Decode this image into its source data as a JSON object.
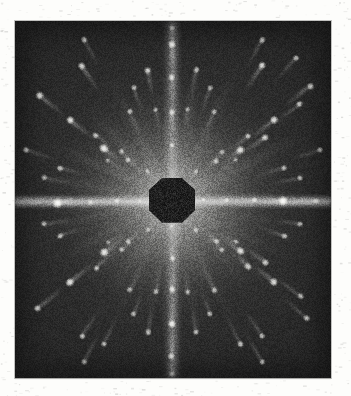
{
  "document": {
    "kind": "x-ray-diffraction-photograph",
    "technique": "Laue transmission photograph",
    "caption": "",
    "paper_color": "#fdfdfb",
    "plate_background_color": "#262626",
    "beam_stop_color": "#1d1d1d",
    "spot_color": "#ffffff"
  },
  "plate": {
    "x": 15,
    "y": 21,
    "width": 316,
    "height": 357,
    "center_x": 172,
    "center_y": 201
  },
  "beam_stop": {
    "shape": "octagon",
    "center_x": 172,
    "center_y": 200,
    "width": 46,
    "height": 45
  },
  "streaks": {
    "horizontal": {
      "y": 201,
      "thickness": 13,
      "length": 316
    },
    "vertical": {
      "x": 172,
      "thickness": 16,
      "length": 357
    }
  },
  "chart_data": {
    "type": "scatter",
    "title": "",
    "subtitle": "",
    "xlabel": "",
    "ylabel": "",
    "xlim": [
      15,
      331
    ],
    "ylim": [
      21,
      378
    ],
    "grid": false,
    "legend": null,
    "series": [
      {
        "name": "diffraction-spots",
        "x": [
          172,
          172,
          172,
          172,
          172,
          172,
          172,
          172,
          58,
          90,
          117,
          140,
          204,
          227,
          254,
          283,
          316,
          104,
          128,
          148,
          196,
          216,
          240,
          265,
          104,
          128,
          148,
          196,
          216,
          240,
          265,
          70,
          96,
          122,
          222,
          248,
          274,
          300,
          70,
          96,
          122,
          222,
          248,
          274,
          300,
          40,
          148,
          196,
          310,
          38,
          148,
          196,
          306,
          82,
          130,
          214,
          262,
          82,
          130,
          214,
          262,
          60,
          108,
          236,
          284,
          60,
          108,
          236,
          284,
          156,
          188,
          156,
          188,
          134,
          210,
          134,
          210,
          44,
          300,
          44,
          300,
          172,
          172,
          26,
          320,
          262,
          84,
          262,
          84,
          172,
          240,
          104,
          296
        ],
        "y": [
          44,
          78,
          112,
          145,
          258,
          290,
          324,
          356,
          203,
          202,
          201,
          201,
          200,
          200,
          200,
          201,
          201,
          148,
          160,
          172,
          172,
          161,
          150,
          138,
          252,
          242,
          230,
          230,
          241,
          251,
          262,
          120,
          135,
          152,
          250,
          266,
          282,
          296,
          282,
          268,
          250,
          152,
          136,
          120,
          104,
          96,
          70,
          70,
          86,
          308,
          332,
          332,
          318,
          66,
          112,
          112,
          66,
          336,
          290,
          290,
          336,
          168,
          160,
          160,
          168,
          236,
          242,
          242,
          236,
          110,
          110,
          292,
          292,
          88,
          88,
          314,
          314,
          178,
          178,
          224,
          224,
          28,
          374,
          150,
          252,
          40,
          40,
          362,
          362,
          226,
          344,
          344,
          58
        ],
        "marker": "round-spot",
        "color": "#ffffff"
      }
    ]
  },
  "spots": [
    {
      "cx": 172,
      "cy": 44,
      "r": 4.2,
      "i": 0.95
    },
    {
      "cx": 172,
      "cy": 78,
      "r": 3.6,
      "i": 0.85
    },
    {
      "cx": 172,
      "cy": 112,
      "r": 3.4,
      "i": 0.8
    },
    {
      "cx": 172,
      "cy": 145,
      "r": 3.0,
      "i": 0.72
    },
    {
      "cx": 172,
      "cy": 258,
      "r": 3.2,
      "i": 0.78
    },
    {
      "cx": 172,
      "cy": 290,
      "r": 3.6,
      "i": 0.86
    },
    {
      "cx": 172,
      "cy": 324,
      "r": 4.0,
      "i": 0.92
    },
    {
      "cx": 172,
      "cy": 356,
      "r": 3.4,
      "i": 0.8
    },
    {
      "cx": 58,
      "cy": 203,
      "r": 5.0,
      "i": 1.0
    },
    {
      "cx": 90,
      "cy": 202,
      "r": 3.2,
      "i": 0.72
    },
    {
      "cx": 117,
      "cy": 201,
      "r": 2.8,
      "i": 0.64
    },
    {
      "cx": 140,
      "cy": 201,
      "r": 2.4,
      "i": 0.56
    },
    {
      "cx": 204,
      "cy": 200,
      "r": 2.6,
      "i": 0.6
    },
    {
      "cx": 227,
      "cy": 200,
      "r": 2.8,
      "i": 0.66
    },
    {
      "cx": 254,
      "cy": 200,
      "r": 3.0,
      "i": 0.7
    },
    {
      "cx": 283,
      "cy": 201,
      "r": 5.2,
      "i": 1.0
    },
    {
      "cx": 316,
      "cy": 201,
      "r": 3.4,
      "i": 0.82
    },
    {
      "cx": 104,
      "cy": 148,
      "r": 4.4,
      "i": 0.94
    },
    {
      "cx": 128,
      "cy": 160,
      "r": 3.0,
      "i": 0.72
    },
    {
      "cx": 148,
      "cy": 172,
      "r": 2.6,
      "i": 0.62
    },
    {
      "cx": 196,
      "cy": 172,
      "r": 2.6,
      "i": 0.62
    },
    {
      "cx": 216,
      "cy": 161,
      "r": 3.0,
      "i": 0.72
    },
    {
      "cx": 240,
      "cy": 150,
      "r": 4.2,
      "i": 0.92
    },
    {
      "cx": 265,
      "cy": 138,
      "r": 3.6,
      "i": 0.84
    },
    {
      "cx": 104,
      "cy": 252,
      "r": 4.4,
      "i": 0.94
    },
    {
      "cx": 128,
      "cy": 242,
      "r": 3.0,
      "i": 0.72
    },
    {
      "cx": 148,
      "cy": 230,
      "r": 2.6,
      "i": 0.62
    },
    {
      "cx": 196,
      "cy": 230,
      "r": 2.8,
      "i": 0.66
    },
    {
      "cx": 216,
      "cy": 241,
      "r": 3.2,
      "i": 0.76
    },
    {
      "cx": 240,
      "cy": 251,
      "r": 4.0,
      "i": 0.9
    },
    {
      "cx": 265,
      "cy": 262,
      "r": 3.4,
      "i": 0.8
    },
    {
      "cx": 70,
      "cy": 120,
      "r": 4.0,
      "i": 0.9
    },
    {
      "cx": 96,
      "cy": 135,
      "r": 3.2,
      "i": 0.76
    },
    {
      "cx": 122,
      "cy": 152,
      "r": 2.8,
      "i": 0.66
    },
    {
      "cx": 222,
      "cy": 250,
      "r": 2.8,
      "i": 0.66
    },
    {
      "cx": 248,
      "cy": 266,
      "r": 3.4,
      "i": 0.8
    },
    {
      "cx": 274,
      "cy": 282,
      "r": 3.8,
      "i": 0.88
    },
    {
      "cx": 300,
      "cy": 296,
      "r": 3.2,
      "i": 0.76
    },
    {
      "cx": 70,
      "cy": 282,
      "r": 4.2,
      "i": 0.92
    },
    {
      "cx": 96,
      "cy": 268,
      "r": 3.2,
      "i": 0.76
    },
    {
      "cx": 122,
      "cy": 250,
      "r": 2.8,
      "i": 0.66
    },
    {
      "cx": 222,
      "cy": 152,
      "r": 2.8,
      "i": 0.66
    },
    {
      "cx": 248,
      "cy": 136,
      "r": 3.2,
      "i": 0.78
    },
    {
      "cx": 274,
      "cy": 120,
      "r": 3.8,
      "i": 0.88
    },
    {
      "cx": 300,
      "cy": 104,
      "r": 3.2,
      "i": 0.76
    },
    {
      "cx": 40,
      "cy": 96,
      "r": 3.8,
      "i": 0.88
    },
    {
      "cx": 148,
      "cy": 70,
      "r": 3.4,
      "i": 0.82
    },
    {
      "cx": 196,
      "cy": 70,
      "r": 3.0,
      "i": 0.74
    },
    {
      "cx": 310,
      "cy": 86,
      "r": 3.4,
      "i": 0.82
    },
    {
      "cx": 38,
      "cy": 308,
      "r": 3.4,
      "i": 0.8
    },
    {
      "cx": 148,
      "cy": 332,
      "r": 3.0,
      "i": 0.74
    },
    {
      "cx": 196,
      "cy": 332,
      "r": 3.0,
      "i": 0.74
    },
    {
      "cx": 306,
      "cy": 318,
      "r": 3.2,
      "i": 0.78
    },
    {
      "cx": 82,
      "cy": 66,
      "r": 3.4,
      "i": 0.82
    },
    {
      "cx": 130,
      "cy": 112,
      "r": 2.8,
      "i": 0.68
    },
    {
      "cx": 214,
      "cy": 112,
      "r": 2.8,
      "i": 0.68
    },
    {
      "cx": 262,
      "cy": 66,
      "r": 3.6,
      "i": 0.86
    },
    {
      "cx": 82,
      "cy": 336,
      "r": 3.2,
      "i": 0.78
    },
    {
      "cx": 130,
      "cy": 290,
      "r": 2.8,
      "i": 0.68
    },
    {
      "cx": 214,
      "cy": 290,
      "r": 3.0,
      "i": 0.72
    },
    {
      "cx": 262,
      "cy": 336,
      "r": 3.0,
      "i": 0.74
    },
    {
      "cx": 60,
      "cy": 168,
      "r": 3.2,
      "i": 0.78
    },
    {
      "cx": 108,
      "cy": 160,
      "r": 2.4,
      "i": 0.58
    },
    {
      "cx": 236,
      "cy": 160,
      "r": 2.6,
      "i": 0.62
    },
    {
      "cx": 284,
      "cy": 168,
      "r": 3.0,
      "i": 0.74
    },
    {
      "cx": 60,
      "cy": 236,
      "r": 3.0,
      "i": 0.74
    },
    {
      "cx": 108,
      "cy": 242,
      "r": 2.4,
      "i": 0.58
    },
    {
      "cx": 236,
      "cy": 242,
      "r": 2.6,
      "i": 0.62
    },
    {
      "cx": 284,
      "cy": 236,
      "r": 3.0,
      "i": 0.74
    },
    {
      "cx": 156,
      "cy": 110,
      "r": 2.6,
      "i": 0.64
    },
    {
      "cx": 188,
      "cy": 110,
      "r": 2.6,
      "i": 0.64
    },
    {
      "cx": 156,
      "cy": 292,
      "r": 2.8,
      "i": 0.68
    },
    {
      "cx": 188,
      "cy": 292,
      "r": 2.8,
      "i": 0.68
    },
    {
      "cx": 134,
      "cy": 88,
      "r": 2.8,
      "i": 0.7
    },
    {
      "cx": 210,
      "cy": 88,
      "r": 2.8,
      "i": 0.7
    },
    {
      "cx": 134,
      "cy": 314,
      "r": 2.8,
      "i": 0.7
    },
    {
      "cx": 210,
      "cy": 314,
      "r": 2.8,
      "i": 0.7
    },
    {
      "cx": 44,
      "cy": 178,
      "r": 2.8,
      "i": 0.7
    },
    {
      "cx": 300,
      "cy": 178,
      "r": 2.8,
      "i": 0.7
    },
    {
      "cx": 44,
      "cy": 224,
      "r": 2.8,
      "i": 0.7
    },
    {
      "cx": 300,
      "cy": 224,
      "r": 2.8,
      "i": 0.7
    },
    {
      "cx": 172,
      "cy": 28,
      "r": 3.0,
      "i": 0.74
    },
    {
      "cx": 172,
      "cy": 374,
      "r": 3.0,
      "i": 0.74
    },
    {
      "cx": 26,
      "cy": 150,
      "r": 3.0,
      "i": 0.74
    },
    {
      "cx": 320,
      "cy": 150,
      "r": 3.0,
      "i": 0.74
    },
    {
      "cx": 262,
      "cy": 40,
      "r": 3.2,
      "i": 0.78
    },
    {
      "cx": 84,
      "cy": 40,
      "r": 3.0,
      "i": 0.74
    },
    {
      "cx": 262,
      "cy": 362,
      "r": 3.2,
      "i": 0.78
    },
    {
      "cx": 84,
      "cy": 362,
      "r": 3.0,
      "i": 0.74
    },
    {
      "cx": 240,
      "cy": 344,
      "r": 3.0,
      "i": 0.74
    },
    {
      "cx": 104,
      "cy": 344,
      "r": 3.0,
      "i": 0.74
    },
    {
      "cx": 296,
      "cy": 58,
      "r": 3.0,
      "i": 0.74
    },
    {
      "cx": 172,
      "cy": 226,
      "r": 2.4,
      "i": 0.58
    }
  ]
}
